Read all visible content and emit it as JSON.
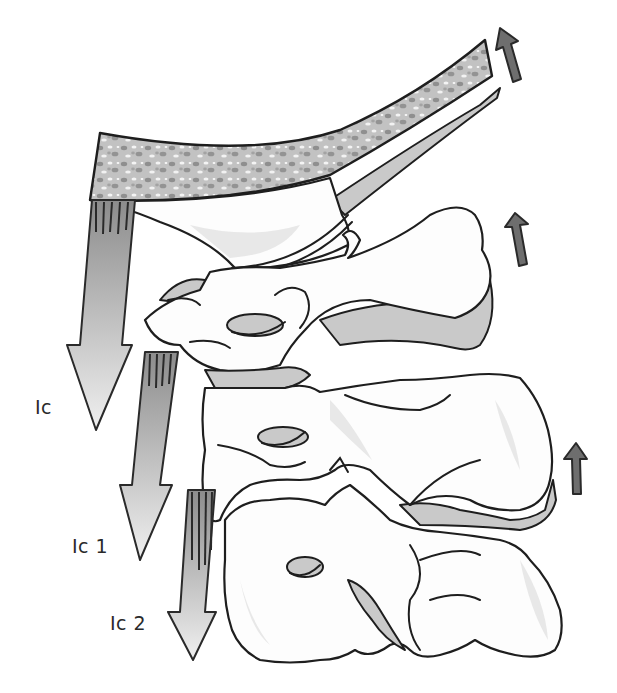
{
  "figure": {
    "labels": [
      {
        "id": "ic",
        "text": "Ic"
      },
      {
        "id": "ic1",
        "text": "Ic 1"
      },
      {
        "id": "ic2",
        "text": "Ic 2"
      }
    ],
    "structures": [
      "skull-base-occipital-bone",
      "atlas-c1",
      "axis-c2",
      "c3-vertebra"
    ],
    "arrows": {
      "downward": 3,
      "upward": 3
    },
    "colors": {
      "bone_fill": "#fdfdfd",
      "outline": "#1e1e1e",
      "shade": "#c9c9c9",
      "up_arrow": "#6e6e6e",
      "down_arrow_top": "#9a9a9a",
      "down_arrow_bottom": "#eeeeee",
      "skull_texture": "#a8a8a8"
    }
  }
}
